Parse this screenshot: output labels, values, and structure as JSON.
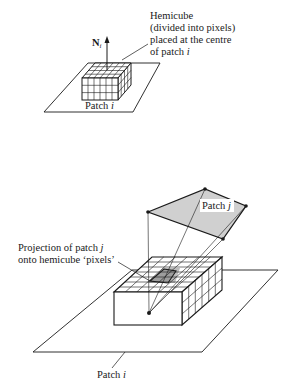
{
  "top_figure": {
    "normal_label": "N",
    "normal_subscript": "i",
    "hemicube_label_lines": [
      "Hemicube",
      "(divided into pixels)",
      "placed at the centre",
      "of patch "
    ],
    "hemicube_label_italic": "i",
    "patch_label": "Patch ",
    "patch_label_italic": "i",
    "grid": {
      "front_cols": 6,
      "front_rows": 3,
      "top_rows": 4
    }
  },
  "bottom_figure": {
    "patch_j_label": "Patch ",
    "patch_j_label_italic": "j",
    "projection_label_lines": [
      "Projection of patch ",
      "onto hemicube ‘pixels’"
    ],
    "projection_label_italic": "j",
    "patch_i_label": "Patch ",
    "patch_i_label_italic": "i",
    "colors": {
      "patch_fill": "#cfcfcf",
      "projection_fill": "#b8b8b8",
      "line": "#1a1a1a"
    }
  }
}
